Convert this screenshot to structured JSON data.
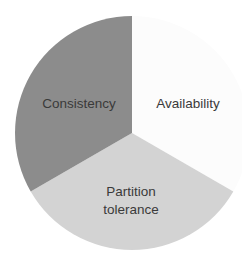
{
  "chart_data": {
    "type": "pie",
    "title": "",
    "categories": [
      "Availability",
      "Partition tolerance",
      "Consistency"
    ],
    "values": [
      33.33,
      33.33,
      33.33
    ],
    "colors": [
      "#fcfcfc",
      "#d3d3d3",
      "#8c8c8c"
    ],
    "start_angle_deg": 0,
    "direction": "clockwise",
    "legend": "none",
    "labels_inside": true,
    "slices": [
      {
        "label": "Availability",
        "value": 33.33,
        "color": "#fcfcfc"
      },
      {
        "label": "Partition tolerance",
        "value": 33.33,
        "color": "#d3d3d3"
      },
      {
        "label": "Consistency",
        "value": 33.33,
        "color": "#8c8c8c"
      }
    ]
  },
  "labels": {
    "consistency": "Consistency",
    "availability": "Availability",
    "partition_line1": "Partition",
    "partition_line2": "tolerance"
  },
  "layout": {
    "cx": 132,
    "cy": 133,
    "r": 117
  }
}
